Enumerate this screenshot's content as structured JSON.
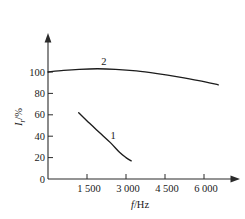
{
  "chart_data": {
    "type": "line",
    "title": "",
    "subtitle": "",
    "xlabel": "f/Hz",
    "ylabel": "I_r/%",
    "xlabel_parts": {
      "symbol": "f",
      "divider": "/",
      "unit": "Hz"
    },
    "ylabel_parts": {
      "symbol": "I",
      "subscript": "r",
      "divider": "/",
      "unit": "%"
    },
    "xlim": [
      0,
      7000
    ],
    "ylim": [
      0,
      110
    ],
    "xticks": [
      1500,
      3000,
      4500,
      6000
    ],
    "xticklabels": [
      "1 500",
      "3 000",
      "4 500",
      "6 000"
    ],
    "yticks": [
      0,
      20,
      40,
      60,
      80,
      100
    ],
    "yticklabels": [
      "0",
      "20",
      "40",
      "60",
      "80",
      "100"
    ],
    "grid": false,
    "legend": "inline-curve-labels",
    "axes_style": "arrow-terminated half-frame",
    "series": [
      {
        "name": "1",
        "label": "1",
        "annotation": "1",
        "color": "#1c1c1c",
        "points": [
          {
            "x": 1180,
            "y": 62
          },
          {
            "x": 1600,
            "y": 52
          },
          {
            "x": 2000,
            "y": 43
          },
          {
            "x": 2400,
            "y": 34
          },
          {
            "x": 2750,
            "y": 25
          },
          {
            "x": 3000,
            "y": 20
          },
          {
            "x": 3200,
            "y": 17
          }
        ]
      },
      {
        "name": "2",
        "label": "2",
        "annotation": "2",
        "color": "#1c1c1c",
        "points": [
          {
            "x": 0,
            "y": 100
          },
          {
            "x": 600,
            "y": 101.5
          },
          {
            "x": 1200,
            "y": 102.5
          },
          {
            "x": 1900,
            "y": 103
          },
          {
            "x": 2600,
            "y": 102.5
          },
          {
            "x": 3400,
            "y": 101
          },
          {
            "x": 4200,
            "y": 98.5
          },
          {
            "x": 5000,
            "y": 95.5
          },
          {
            "x": 5800,
            "y": 92
          },
          {
            "x": 6550,
            "y": 88
          }
        ]
      }
    ],
    "annotations": [
      {
        "text": "2",
        "x": 2150,
        "y": 107,
        "name": "curve-2-label"
      },
      {
        "text": "1",
        "x": 2500,
        "y": 37,
        "name": "curve-1-label"
      }
    ]
  }
}
